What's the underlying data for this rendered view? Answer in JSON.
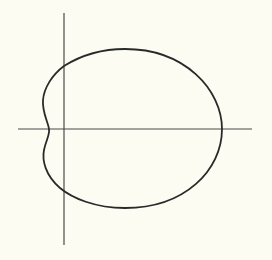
{
  "diagram": {
    "type": "polar-curve",
    "background": "#fcfcf2",
    "axis_color": "#4a4a4a",
    "curve_color": "#2a2a2a",
    "axes": {
      "origin": [
        64,
        129
      ],
      "x_axis": {
        "from": 18,
        "to": 252
      },
      "y_axis": {
        "from": 13,
        "to": 245
      }
    },
    "curve": {
      "rightmost": [
        222,
        129
      ],
      "top": [
        125,
        49
      ],
      "bottom": [
        125,
        208
      ],
      "left_dimple": [
        49,
        129
      ],
      "y_axis_crossings": [
        66,
        192
      ]
    }
  }
}
